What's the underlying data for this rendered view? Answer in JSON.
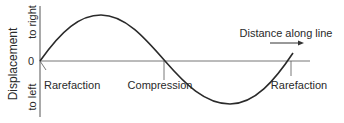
{
  "diagram": {
    "y_axis": {
      "title": "Displacement",
      "top_label": "to right",
      "bottom_label": "to left",
      "zero_label": "0"
    },
    "x_axis": {
      "direction_label": "Distance along line"
    },
    "annotations": [
      {
        "label": "Rarefaction"
      },
      {
        "label": "Compression"
      },
      {
        "label": "Rarefaction"
      }
    ],
    "colors": {
      "line": "#2a2a2a",
      "axis": "#555555",
      "background": "#ffffff"
    }
  }
}
